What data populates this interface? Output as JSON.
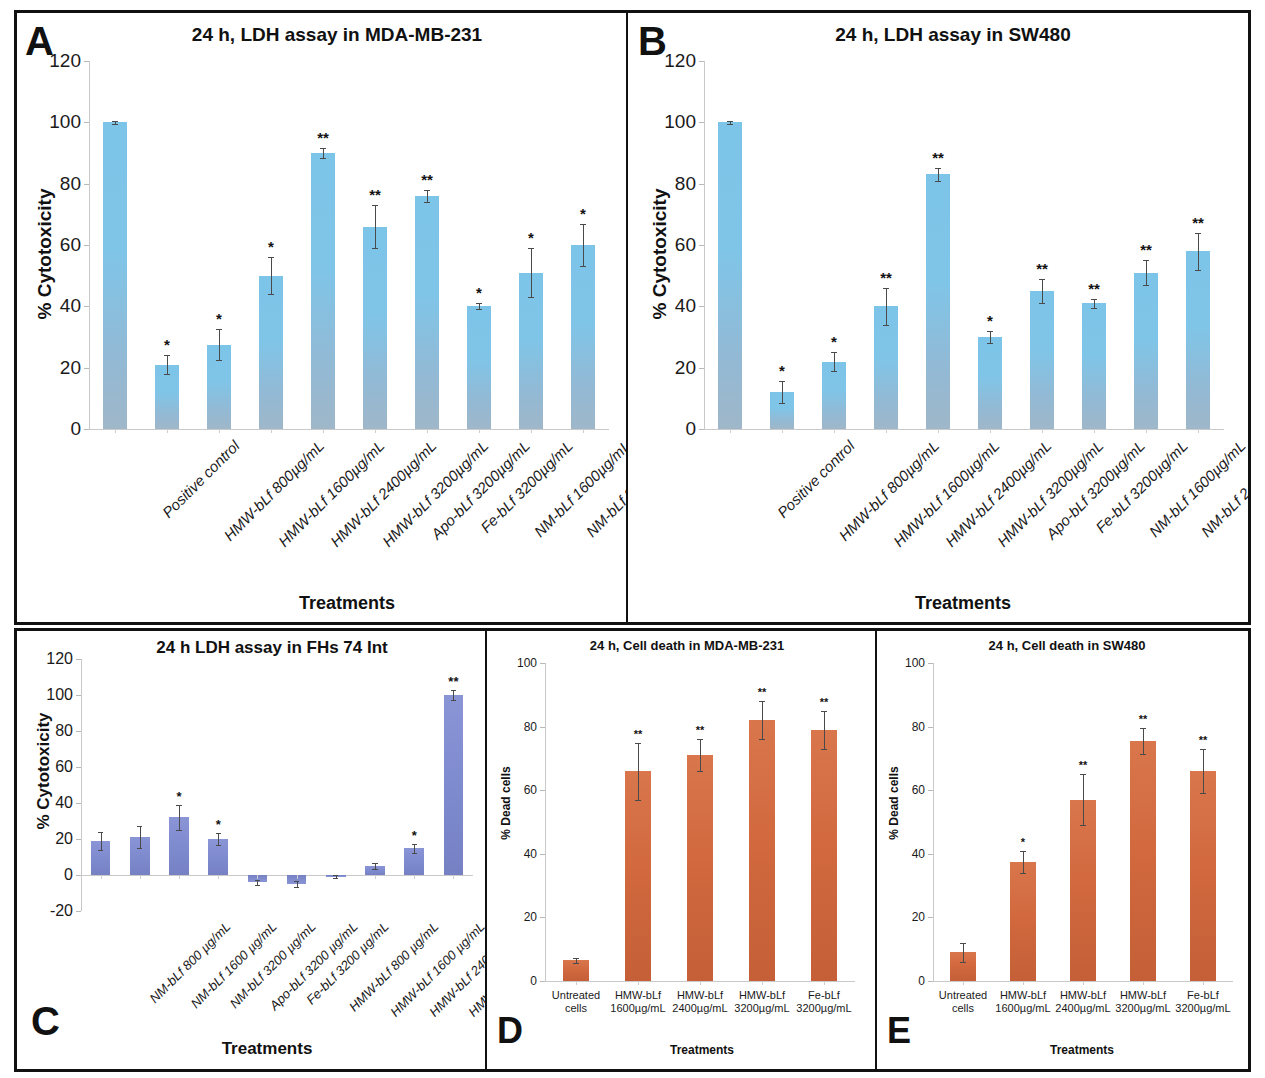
{
  "figure": {
    "panels": [
      "A",
      "B",
      "C",
      "D",
      "E"
    ]
  },
  "panelA": {
    "letter": "A",
    "title": "24 h, LDH assay in MDA-MB-231",
    "ylabel": "% Cytotoxicity",
    "xlabel": "Treatments"
  },
  "panelB": {
    "letter": "B",
    "title": "24 h, LDH assay in SW480",
    "ylabel": "% Cytotoxicity",
    "xlabel": "Treatments"
  },
  "panelC": {
    "letter": "C",
    "title": "24 h LDH assay in FHs 74 Int",
    "ylabel": "% Cytotoxicity",
    "xlabel": "Treatments"
  },
  "panelD": {
    "letter": "D",
    "title": "24 h, Cell death in MDA-MB-231",
    "ylabel": "% Dead cells",
    "xlabel": "Treatments"
  },
  "panelE": {
    "letter": "E",
    "title": "24 h, Cell death in SW480",
    "ylabel": "% Dead cells",
    "xlabel": "Treatments"
  },
  "colors": {
    "bar_blue": "#7cc4e8",
    "bar_blue_bottom": "#9fb7c9",
    "bar_purple": "#7d8ace",
    "bar_orange": "#d2693f",
    "axis": "#c9c9c9",
    "text": "#111111",
    "frame": "#111111"
  },
  "chart_data": [
    {
      "panel": "A",
      "type": "bar",
      "title": "24 h, LDH assay in MDA-MB-231",
      "xlabel": "Treatments",
      "ylabel": "% Cytotoxicity",
      "ylim": [
        0,
        120
      ],
      "yticks": [
        0,
        20,
        40,
        60,
        80,
        100,
        120
      ],
      "grid": false,
      "legend": "none",
      "bar_color": "#7cc4e8",
      "categories": [
        "Positive control",
        "HMW-bLf 800µg/mL",
        "HMW-bLf 1600µg/mL",
        "HMW-bLf 2400µg/mL",
        "HMW-bLf 3200µg/mL",
        "Apo-bLf 3200µg/mL",
        "Fe-bLf 3200µg/mL",
        "NM-bLf 1600µg/mL",
        "NM-bLf 2400µg/mL",
        "NM-bLf 3200µg/mL"
      ],
      "values": [
        100,
        21,
        27.5,
        50,
        90,
        66,
        76,
        40,
        51,
        60
      ],
      "errors": [
        0.5,
        3,
        5,
        6,
        1.5,
        7,
        2,
        1,
        8,
        7
      ],
      "significance": [
        "",
        "*",
        "*",
        "*",
        "**",
        "**",
        "**",
        "*",
        "*",
        "*"
      ]
    },
    {
      "panel": "B",
      "type": "bar",
      "title": "24 h, LDH assay in SW480",
      "xlabel": "Treatments",
      "ylabel": "% Cytotoxicity",
      "ylim": [
        0,
        120
      ],
      "yticks": [
        0,
        20,
        40,
        60,
        80,
        100,
        120
      ],
      "grid": false,
      "legend": "none",
      "bar_color": "#7cc4e8",
      "categories": [
        "Positive control",
        "HMW-bLf 800µg/mL",
        "HMW-bLf 1600µg/mL",
        "HMW-bLf 2400µg/mL",
        "HMW-bLf 3200µg/mL",
        "Apo-bLf 3200µg/mL",
        "Fe-bLf 3200µg/mL",
        "NM-bLf 1600µg/mL",
        "NM-bLf 2400µg/mL",
        "NM-bLf 3200µg/mL"
      ],
      "values": [
        100,
        12,
        22,
        40,
        83,
        30,
        45,
        41,
        51,
        58
      ],
      "errors": [
        0.5,
        3.5,
        3,
        6,
        2,
        2,
        4,
        1.5,
        4,
        6
      ],
      "significance": [
        "",
        "*",
        "*",
        "**",
        "**",
        "*",
        "**",
        "**",
        "**",
        "**"
      ]
    },
    {
      "panel": "C",
      "type": "bar",
      "title": "24 h LDH assay in FHs 74 Int",
      "xlabel": "Treatments",
      "ylabel": "% Cytotoxicity",
      "ylim": [
        -20,
        120
      ],
      "yticks": [
        -20,
        0,
        20,
        40,
        60,
        80,
        100,
        120
      ],
      "grid": false,
      "legend": "none",
      "bar_color": "#7d8ace",
      "categories": [
        "NM-bLf 800 µg/mL",
        "NM-bLf 1600 µg/mL",
        "NM-bLf 3200 µg/mL",
        "Apo-bLf 3200 µg/mL",
        "Fe-bLf 3200 µg/mL",
        "HMW-bLf 800 µg/mL",
        "HMW-bLf 1600 µg/mL",
        "HMW-bLf 2400 µg/mL",
        "HMW-bLf 3200 µg/mL",
        "Triton X 100"
      ],
      "values": [
        19,
        21,
        32,
        20,
        -4,
        -5,
        -1,
        5,
        15,
        100
      ],
      "errors": [
        5,
        6,
        7,
        3.5,
        1.5,
        1.5,
        0.8,
        1.5,
        2.5,
        3
      ],
      "significance": [
        "",
        "",
        "*",
        "*",
        "",
        "",
        "",
        "",
        "*",
        "**"
      ]
    },
    {
      "panel": "D",
      "type": "bar",
      "title": "24 h, Cell death in MDA-MB-231",
      "xlabel": "Treatments",
      "ylabel": "% Dead cells",
      "ylim": [
        0,
        100
      ],
      "yticks": [
        0,
        20,
        40,
        60,
        80,
        100
      ],
      "grid": false,
      "legend": "none",
      "bar_color": "#d2693f",
      "categories": [
        "Untreated\ncells",
        "HMW-bLf\n1600µg/mL",
        "HMW-bLf\n2400µg/mL",
        "HMW-bLf\n3200µg/mL",
        "Fe-bLf\n3200µg/mL"
      ],
      "values": [
        6.5,
        66,
        71,
        82,
        79
      ],
      "errors": [
        0.8,
        9,
        5,
        6,
        6
      ],
      "significance": [
        "",
        "**",
        "**",
        "**",
        "**"
      ]
    },
    {
      "panel": "E",
      "type": "bar",
      "title": "24 h, Cell death in SW480",
      "xlabel": "Treatments",
      "ylabel": "% Dead cells",
      "ylim": [
        0,
        100
      ],
      "yticks": [
        0,
        20,
        40,
        60,
        80,
        100
      ],
      "grid": false,
      "legend": "none",
      "bar_color": "#d2693f",
      "categories": [
        "Untreated\ncells",
        "HMW-bLf\n1600µg/mL",
        "HMW-bLf\n2400µg/mL",
        "HMW-bLf\n3200µg/mL",
        "Fe-bLf\n3200µg/mL"
      ],
      "values": [
        9,
        37.5,
        57,
        75.5,
        66
      ],
      "errors": [
        3,
        3.5,
        8,
        4,
        7
      ],
      "significance": [
        "",
        "*",
        "**",
        "**",
        "**"
      ]
    }
  ]
}
